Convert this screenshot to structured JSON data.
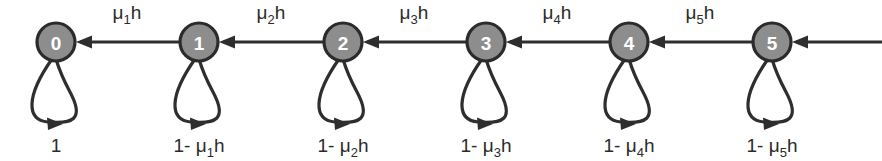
{
  "figure": {
    "kind": "markov-chain-state-transition-diagram",
    "background_color": "#ffffff",
    "ink_color": "#2e2e2e",
    "node_fill_color": "#8d8d8d",
    "node_label_color": "#ffffff"
  },
  "nodes": [
    {
      "id": "0",
      "label": "0",
      "cx": 56,
      "cy": 42,
      "r": 19
    },
    {
      "id": "1",
      "label": "1",
      "cx": 199,
      "cy": 42,
      "r": 19
    },
    {
      "id": "2",
      "label": "2",
      "cx": 343,
      "cy": 42,
      "r": 19
    },
    {
      "id": "3",
      "label": "3",
      "cx": 486,
      "cy": 42,
      "r": 19
    },
    {
      "id": "4",
      "label": "4",
      "cx": 629,
      "cy": 42,
      "r": 19
    },
    {
      "id": "5",
      "label": "5",
      "cx": 772,
      "cy": 42,
      "r": 19
    }
  ],
  "transitions": [
    {
      "from": "1",
      "to": "0",
      "base": "μ",
      "sub": "1",
      "tail": "h",
      "label": "μ₁h",
      "label_x": 127,
      "label_y": 19
    },
    {
      "from": "2",
      "to": "1",
      "base": "μ",
      "sub": "2",
      "tail": "h",
      "label": "μ₂h",
      "label_x": 271,
      "label_y": 19
    },
    {
      "from": "3",
      "to": "2",
      "base": "μ",
      "sub": "3",
      "tail": "h",
      "label": "μ₃h",
      "label_x": 414,
      "label_y": 19
    },
    {
      "from": "4",
      "to": "3",
      "base": "μ",
      "sub": "4",
      "tail": "h",
      "label": "μ₄h",
      "label_x": 557,
      "label_y": 19
    },
    {
      "from": "5",
      "to": "4",
      "base": "μ",
      "sub": "5",
      "tail": "h",
      "label": "μ₅h",
      "label_x": 700,
      "label_y": 19
    }
  ],
  "incoming_edge": {
    "label": "",
    "from_x": 882,
    "to_x": 791,
    "y": 42,
    "description": "arrow entering state 5 from the right boundary"
  },
  "self_loops": [
    {
      "node": "0",
      "prefix": "1",
      "minus": "",
      "base": "",
      "sub": "",
      "tail": "",
      "label": "1",
      "label_x": 56,
      "label_y": 146
    },
    {
      "node": "1",
      "prefix": "1-",
      "minus": "-",
      "base": "μ",
      "sub": "1",
      "tail": "h",
      "label": "1- μ₁h",
      "label_x": 199,
      "label_y": 146
    },
    {
      "node": "2",
      "prefix": "1-",
      "minus": "-",
      "base": "μ",
      "sub": "2",
      "tail": "h",
      "label": "1- μ₂h",
      "label_x": 343,
      "label_y": 146
    },
    {
      "node": "3",
      "prefix": "1-",
      "minus": "-",
      "base": "μ",
      "sub": "3",
      "tail": "h",
      "label": "1- μ₃h",
      "label_x": 486,
      "label_y": 146
    },
    {
      "node": "4",
      "prefix": "1-",
      "minus": "-",
      "base": "μ",
      "sub": "4",
      "tail": "h",
      "label": "1- μ₄h",
      "label_x": 629,
      "label_y": 146
    },
    {
      "node": "5",
      "prefix": "1-",
      "minus": "-",
      "base": "μ",
      "sub": "5",
      "tail": "h",
      "label": "1- μ₅h",
      "label_x": 772,
      "label_y": 146
    }
  ]
}
